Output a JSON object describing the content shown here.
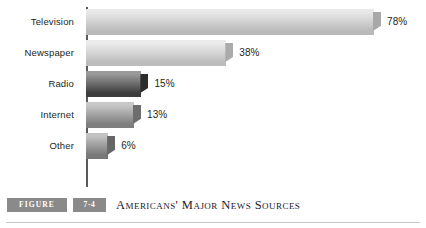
{
  "chart_data": {
    "type": "bar",
    "orientation": "horizontal",
    "title": "Americans' Major News Sources",
    "xlabel": "",
    "ylabel": "",
    "xlim": [
      0,
      78
    ],
    "grid": false,
    "legend": null,
    "categories": [
      "Television",
      "Newspaper",
      "Radio",
      "Internet",
      "Other"
    ],
    "values": [
      78,
      38,
      15,
      13,
      6
    ],
    "value_labels": [
      "78%",
      "38%",
      "15%",
      "13%",
      "6%"
    ],
    "bars": [
      {
        "category": "Television",
        "value": 78,
        "value_label": "78%",
        "color_top": "#e9e9e9",
        "color_front": "#d3d3d3",
        "color_bottom": "#b9b9b9",
        "color_cap": "#a8a8a8"
      },
      {
        "category": "Newspaper",
        "value": 38,
        "value_label": "38%",
        "color_top": "#ececec",
        "color_front": "#d6d6d6",
        "color_bottom": "#bcbcbc",
        "color_cap": "#ababab"
      },
      {
        "category": "Radio",
        "value": 15,
        "value_label": "15%",
        "color_top": "#9a9a9a",
        "color_front": "#6f6f6f",
        "color_bottom": "#3c3c3c",
        "color_cap": "#2c2c2c"
      },
      {
        "category": "Internet",
        "value": 13,
        "value_label": "13%",
        "color_top": "#c8c8c8",
        "color_front": "#a5a5a5",
        "color_bottom": "#7e7e7e",
        "color_cap": "#6d6d6d"
      },
      {
        "category": "Other",
        "value": 6,
        "value_label": "6%",
        "color_top": "#c3c3c3",
        "color_front": "#9e9e9e",
        "color_bottom": "#787878",
        "color_cap": "#666666"
      }
    ],
    "axis_color": "#5a5a5a"
  },
  "caption": {
    "figure_label": "FIGURE",
    "figure_number": "7-4",
    "title": "Americans' Major News Sources",
    "badge_color": "#8a8a8a",
    "rule_color": "#c9c9c9"
  }
}
